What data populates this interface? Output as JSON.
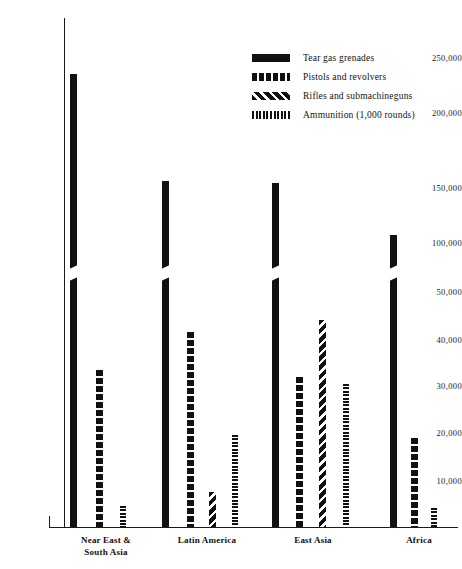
{
  "chart_data": {
    "type": "bar",
    "title": "",
    "subtitle": "",
    "xlabel": "",
    "ylabel": "",
    "grid": false,
    "legend_position": "top-right",
    "axis_note": "broken y-axis: 0-50,000 in 10,000 steps, then 50,000-250,000 in 50,000 steps",
    "ytick_labels": [
      "250,000",
      "200,000",
      "150,000",
      "100,000",
      "50,000",
      "40,000",
      "30,000",
      "20,000",
      "10,000"
    ],
    "ytick_values": [
      250000,
      200000,
      150000,
      100000,
      50000,
      40000,
      30000,
      20000,
      10000
    ],
    "ylim": [
      0,
      260000
    ],
    "categories": [
      "Near East & South Asia",
      "Latin America",
      "East Asia",
      "Africa"
    ],
    "category_lines": [
      [
        "Near East &",
        "South Asia"
      ],
      [
        "Latin America"
      ],
      [
        "East Asia"
      ],
      [
        "Africa"
      ]
    ],
    "series": [
      {
        "name": "Tear gas grenades",
        "pattern": "solid",
        "values": [
          236000,
          145000,
          143000,
          99000
        ]
      },
      {
        "name": "Pistols and revolvers",
        "pattern": "dashed-blocks",
        "values": [
          33500,
          41500,
          32000,
          19000
        ]
      },
      {
        "name": "Rifles and submachineguns",
        "pattern": "diagonal-hatch",
        "values": [
          null,
          7500,
          44000,
          null
        ]
      },
      {
        "name": "Ammunition (1,000 rounds)",
        "pattern": "vertical-stripes",
        "values": [
          4500,
          19500,
          30500,
          4000
        ]
      }
    ]
  },
  "legend": {
    "items": [
      {
        "label": "Tear gas grenades",
        "swatch": "solid-swatch"
      },
      {
        "label": "Pistols and revolvers",
        "swatch": "dashed-blocks-swatch"
      },
      {
        "label": "Rifles and submachineguns",
        "swatch": "diagonal-hatch-swatch"
      },
      {
        "label": "Ammunition (1,000 rounds)",
        "swatch": "vertical-stripes-swatch"
      }
    ]
  },
  "colors": {
    "ink": "#111111",
    "background": "#ffffff"
  }
}
